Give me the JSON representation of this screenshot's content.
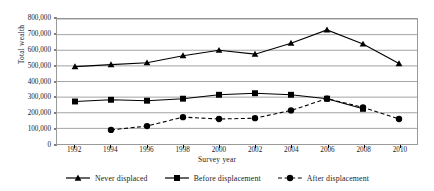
{
  "chart_data": {
    "type": "line",
    "title": "",
    "xlabel": "Survey year",
    "ylabel": "Total wealth",
    "x": [
      1992,
      1994,
      1996,
      1998,
      2000,
      2002,
      2004,
      2006,
      2008,
      2010
    ],
    "xtick_labels": [
      "1992",
      "1994",
      "1996",
      "1998",
      "2000",
      "2002",
      "2004",
      "2006",
      "2008",
      "2010"
    ],
    "ytick_labels": [
      "0",
      "100,000",
      "200,000",
      "300,000",
      "400,000",
      "500,000",
      "600,000",
      "700,000",
      "800,000"
    ],
    "ytick_values": [
      0,
      100000,
      200000,
      300000,
      400000,
      500000,
      600000,
      700000,
      800000
    ],
    "ylim": [
      0,
      800000
    ],
    "xlim": [
      1991,
      2011
    ],
    "grid": "horizontal",
    "legend_position": "bottom",
    "series": [
      {
        "name": "Never displaced",
        "marker": "triangle",
        "linestyle": "solid",
        "color": "#000000",
        "x": [
          1992,
          1994,
          1996,
          1998,
          2000,
          2002,
          2004,
          2006,
          2008,
          2010
        ],
        "values": [
          495000,
          508000,
          520000,
          565000,
          600000,
          575000,
          645000,
          730000,
          640000,
          515000
        ]
      },
      {
        "name": "Before displacement",
        "marker": "square",
        "linestyle": "solid",
        "color": "#000000",
        "x": [
          1992,
          1994,
          1996,
          1998,
          2000,
          2002,
          2004,
          2006,
          2008
        ],
        "values": [
          272000,
          283000,
          277000,
          290000,
          315000,
          325000,
          315000,
          290000,
          225000
        ]
      },
      {
        "name": "After displacement",
        "marker": "circle",
        "linestyle": "dashed",
        "color": "#000000",
        "x": [
          1994,
          1996,
          1998,
          2000,
          2002,
          2004,
          2006,
          2008,
          2010
        ],
        "values": [
          90000,
          115000,
          172000,
          160000,
          165000,
          215000,
          290000,
          235000,
          160000
        ]
      }
    ]
  }
}
